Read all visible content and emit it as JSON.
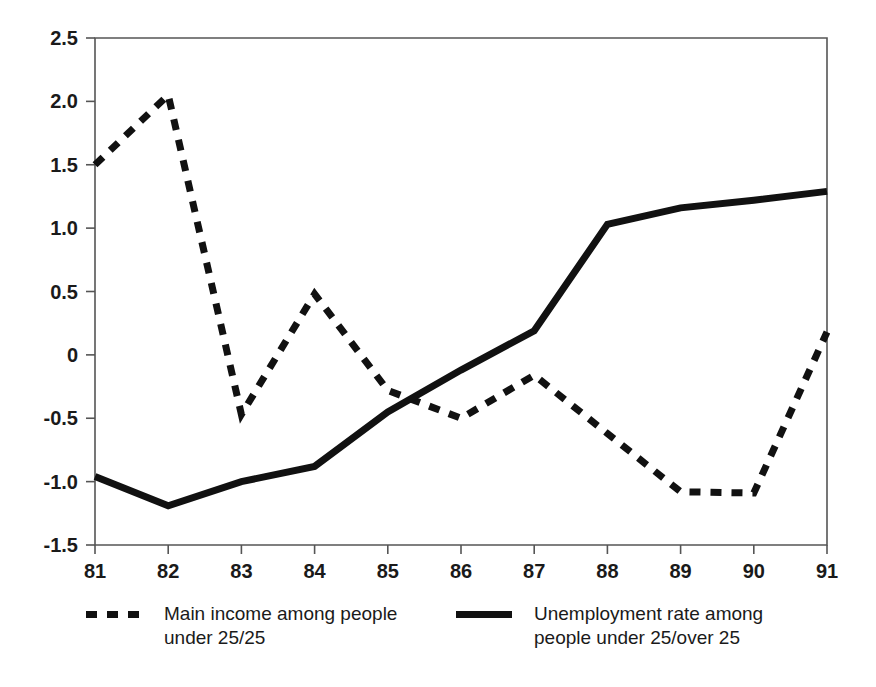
{
  "chart_data": {
    "type": "line",
    "title": "",
    "subtitle": "",
    "xlabel": "",
    "ylabel": "",
    "x": [
      81,
      82,
      83,
      84,
      85,
      86,
      87,
      88,
      89,
      90,
      91
    ],
    "xtick_labels": [
      "81",
      "82",
      "83",
      "84",
      "85",
      "86",
      "87",
      "88",
      "89",
      "90",
      "91"
    ],
    "ytick_labels": [
      "2.5",
      "2.0",
      "1.5",
      "1.0",
      "0.5",
      "0",
      "-0.5",
      "-1.0",
      "-1.5"
    ],
    "ytick_values": [
      2.5,
      2.0,
      1.5,
      1.0,
      0.5,
      0,
      -0.5,
      -1.0,
      -1.5
    ],
    "xlim": [
      81,
      91
    ],
    "ylim": [
      -1.5,
      2.5
    ],
    "grid": false,
    "frame": true,
    "legend_position": "bottom",
    "series": [
      {
        "name": "Main income among people under 25/25",
        "style": "dashed",
        "color": "#111111",
        "width": 7,
        "values": [
          1.5,
          2.05,
          -0.47,
          0.48,
          -0.28,
          -0.5,
          -0.16,
          -0.62,
          -1.08,
          -1.09,
          0.18
        ]
      },
      {
        "name": "Unemployment rate among people under 25/over 25",
        "style": "solid",
        "color": "#111111",
        "width": 7,
        "values": [
          -0.96,
          -1.19,
          -1.0,
          -0.88,
          -0.45,
          -0.12,
          0.19,
          1.03,
          1.16,
          1.22,
          1.29
        ]
      }
    ]
  },
  "legend": {
    "entries": [
      {
        "swatch": "dashed-line-swatch",
        "line1": "Main income among people",
        "line2": "under 25/25"
      },
      {
        "swatch": "solid-line-swatch",
        "line1": "Unemployment rate among",
        "line2": "people under 25/over 25"
      }
    ]
  },
  "colors": {
    "line": "#111111",
    "axis": "#555555",
    "text": "#1a1a1a",
    "background": "#ffffff"
  }
}
